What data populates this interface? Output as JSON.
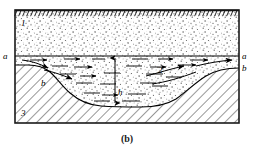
{
  "figure": {
    "caption": "(b)",
    "type": "geological-cross-section",
    "frame": {
      "x": 14,
      "y": 9,
      "width": 226,
      "height": 115
    },
    "colors": {
      "ink": "#000000",
      "frame": "#1a1a1a",
      "stipple": "#2b2b2b",
      "hatch": "#3a3a3a",
      "background": "#ffffff"
    },
    "regions": [
      {
        "id": "1",
        "label": "1",
        "name": "upper-stippled-layer",
        "description": "upper granular layer",
        "label_x": 22,
        "label_y": 23
      },
      {
        "id": "2",
        "label": "2",
        "name": "channel-fill-layer",
        "description": "channel fill with flow",
        "label_x": 160,
        "label_y": 71
      },
      {
        "id": "3",
        "label": "3",
        "name": "bedrock-hatched-layer",
        "description": "impermeable hatched base",
        "label_x": 22,
        "label_y": 113
      }
    ],
    "boundary_labels": [
      {
        "id": "a-left",
        "text": "a",
        "name": "boundary-label-a-left",
        "x": 5,
        "y": 56
      },
      {
        "id": "a-right",
        "text": "a",
        "name": "boundary-label-a-right",
        "x": 243,
        "y": 56
      },
      {
        "id": "b-right",
        "text": "b",
        "name": "boundary-label-b-right",
        "x": 243,
        "y": 68
      },
      {
        "id": "b-curve-left",
        "text": "b",
        "name": "boundary-label-b-curve",
        "x": 43,
        "y": 83
      }
    ],
    "dimension": {
      "id": "h",
      "text": "h",
      "name": "depth-dimension-h",
      "label_x": 120,
      "label_y": 92,
      "arrow_x": 115,
      "arrow_top": 58,
      "arrow_bottom": 103
    },
    "lines": {
      "a_line_y": 56,
      "a_line_x1": 15,
      "a_line_x2": 239,
      "top_hatch_y": 14
    }
  }
}
